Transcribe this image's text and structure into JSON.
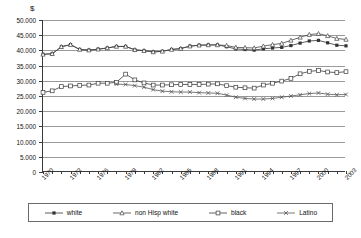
{
  "axis_unit_label": "$",
  "caption": "",
  "chart_data": {
    "type": "line",
    "title": "",
    "subtitle": "",
    "xlabel": "",
    "ylabel": "$",
    "ylim": [
      0,
      50000
    ],
    "ytick_step": 5000,
    "ytick_labels": [
      "50.000",
      "45.000",
      "40.000",
      "35.000",
      "30.000",
      "25.000",
      "20.000",
      "15.000",
      "10.000",
      "5.000",
      "0"
    ],
    "ytick_values": [
      50000,
      45000,
      40000,
      35000,
      30000,
      25000,
      20000,
      15000,
      10000,
      5000,
      0
    ],
    "grid": true,
    "grid_axis": "y",
    "legend_position": "bottom",
    "xlim": [
      1970,
      2003
    ],
    "x": [
      1970,
      1971,
      1972,
      1973,
      1974,
      1975,
      1976,
      1977,
      1978,
      1979,
      1980,
      1981,
      1982,
      1983,
      1984,
      1985,
      1986,
      1987,
      1988,
      1989,
      1990,
      1991,
      1992,
      1993,
      1994,
      1995,
      1996,
      1997,
      1998,
      1999,
      2000,
      2001,
      2002,
      2003
    ],
    "xtick_labels": [
      "1970",
      "1973",
      "1976",
      "1979",
      "1982",
      "1985",
      "1988",
      "1991",
      "1994",
      "1997",
      "2000",
      "2003"
    ],
    "xtick_label_values": [
      1970,
      1973,
      1976,
      1979,
      1982,
      1985,
      1988,
      1991,
      1994,
      1997,
      2000,
      2003
    ],
    "xtick_rotation_deg": -45,
    "series": [
      {
        "name": "white",
        "marker": "filled-square",
        "color": "#333333",
        "values": [
          38700,
          38900,
          41200,
          41900,
          40300,
          40100,
          40400,
          40800,
          41300,
          41300,
          40200,
          39900,
          39500,
          39700,
          40300,
          40600,
          41400,
          41700,
          41800,
          41800,
          41200,
          40500,
          40300,
          40100,
          40500,
          40800,
          41000,
          41600,
          42400,
          43100,
          43300,
          42500,
          41700,
          41500
        ]
      },
      {
        "name": "non Hisp white",
        "marker": "open-triangle",
        "color": "#444444",
        "values": [
          38700,
          38900,
          41200,
          41900,
          40300,
          40100,
          40400,
          40800,
          41300,
          41300,
          40200,
          39900,
          39500,
          39700,
          40300,
          40600,
          41400,
          41700,
          41800,
          41800,
          41600,
          41000,
          40900,
          40800,
          41400,
          41900,
          42300,
          43300,
          44300,
          45200,
          45500,
          44800,
          43900,
          43600
        ]
      },
      {
        "name": "black",
        "marker": "open-square",
        "color": "#3a3a3a",
        "values": [
          26200,
          26700,
          28100,
          28300,
          28500,
          28600,
          29200,
          29200,
          29500,
          32200,
          30300,
          29300,
          28600,
          28600,
          28700,
          28800,
          28800,
          28800,
          28900,
          29000,
          28400,
          27900,
          27700,
          27600,
          28600,
          29200,
          29900,
          30800,
          32300,
          33100,
          33400,
          32900,
          32700,
          33000
        ]
      },
      {
        "name": "Latino",
        "marker": "x",
        "color": "#555555",
        "values": [
          null,
          null,
          null,
          null,
          null,
          null,
          null,
          null,
          28900,
          28800,
          28400,
          27900,
          27100,
          26600,
          26400,
          26300,
          26300,
          26100,
          26000,
          25900,
          25300,
          24600,
          24200,
          24000,
          24000,
          24200,
          24600,
          25000,
          25400,
          25800,
          26000,
          25600,
          25400,
          25500
        ]
      }
    ]
  },
  "legend": {
    "entries": [
      {
        "label": "white",
        "marker": "filled-square"
      },
      {
        "label": "non Hisp white",
        "marker": "open-triangle"
      },
      {
        "label": "black",
        "marker": "open-square"
      },
      {
        "label": "Latino",
        "marker": "x"
      }
    ]
  }
}
